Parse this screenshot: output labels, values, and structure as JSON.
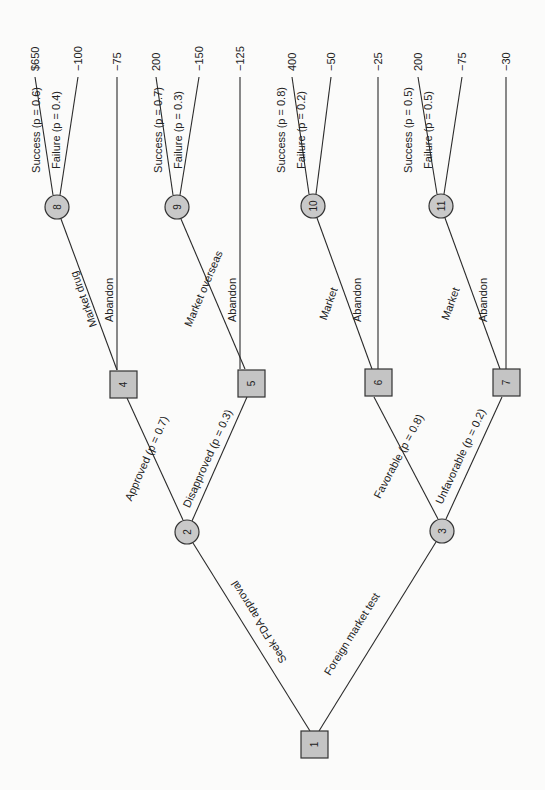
{
  "diagram": {
    "type": "decision-tree",
    "orientation": "rotated 90 degrees counterclockwise (root at bottom, payoffs at top)",
    "nodes": {
      "n1": {
        "id": "1",
        "kind": "decision"
      },
      "n2": {
        "id": "2",
        "kind": "chance"
      },
      "n3": {
        "id": "3",
        "kind": "chance"
      },
      "n4": {
        "id": "4",
        "kind": "decision"
      },
      "n5": {
        "id": "5",
        "kind": "decision"
      },
      "n6": {
        "id": "6",
        "kind": "decision"
      },
      "n7": {
        "id": "7",
        "kind": "decision"
      },
      "n8": {
        "id": "8",
        "kind": "chance"
      },
      "n9": {
        "id": "9",
        "kind": "chance"
      },
      "n10": {
        "id": "10",
        "kind": "chance"
      },
      "n11": {
        "id": "11",
        "kind": "chance"
      }
    },
    "edges": {
      "e1_2": {
        "label": "Seek FDA approval"
      },
      "e1_3": {
        "label": "Foreign market test"
      },
      "e2_4": {
        "label": "Approved (p = 0.7)"
      },
      "e2_5": {
        "label": "Disapproved (p = 0.3)"
      },
      "e3_6": {
        "label": "Favorable (p = 0.8)"
      },
      "e3_7": {
        "label": "Unfavorable (p = 0.2)"
      },
      "e4_8": {
        "label": "Market drug"
      },
      "e4_t": {
        "label": "Abandon"
      },
      "e5_9": {
        "label": "Market overseas"
      },
      "e5_t": {
        "label": "Abandon"
      },
      "e6_10": {
        "label": "Market"
      },
      "e6_t": {
        "label": "Abandon"
      },
      "e7_11": {
        "label": "Market"
      },
      "e7_t": {
        "label": "Abandon"
      },
      "e8_s": {
        "label": "Success (p = 0.6)"
      },
      "e8_f": {
        "label": "Failure (p = 0.4)"
      },
      "e9_s": {
        "label": "Success (p = 0.7)"
      },
      "e9_f": {
        "label": "Failure (p = 0.3)"
      },
      "e10_s": {
        "label": "Success (p = 0.8)"
      },
      "e10_f": {
        "label": "Failure (p = 0.2)"
      },
      "e11_s": {
        "label": "Success (p = 0.5)"
      },
      "e11_f": {
        "label": "Failure (p = 0.5)"
      }
    },
    "payoffs": {
      "t8s": "$650",
      "t8f": "−100",
      "t4a": "−75",
      "t9s": "200",
      "t9f": "−150",
      "t5a": "−125",
      "t10s": "400",
      "t10f": "−50",
      "t6a": "−25",
      "t11s": "200",
      "t11f": "−75",
      "t7a": "−30"
    }
  }
}
